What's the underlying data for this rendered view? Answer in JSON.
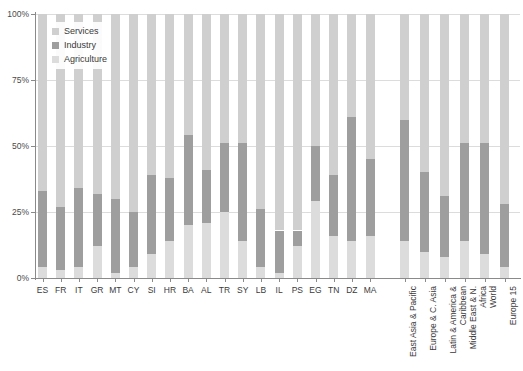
{
  "chart_data": {
    "type": "bar",
    "subtype": "stacked-100-percent",
    "title": "",
    "xlabel": "",
    "ylabel": "",
    "ylim": [
      0,
      100
    ],
    "ytick_labels": [
      "0%",
      "25%",
      "50%",
      "75%",
      "100%"
    ],
    "yticks": [
      0,
      25,
      50,
      75,
      100
    ],
    "grid": "horizontal",
    "legend_position": "top-left",
    "stack_order_bottom_to_top": [
      "Agriculture",
      "Industry",
      "Services"
    ],
    "series": [
      {
        "name": "Services",
        "color": "#cfcfcf"
      },
      {
        "name": "Industry",
        "color": "#9e9e9e"
      },
      {
        "name": "Agriculture",
        "color": "#dcdcdc"
      }
    ],
    "groups": [
      {
        "name": "countries",
        "categories": [
          "ES",
          "FR",
          "IT",
          "GR",
          "MT",
          "CY",
          "SI",
          "HR",
          "BA",
          "AL",
          "TR",
          "SY",
          "LB",
          "IL",
          "PS",
          "EG",
          "TN",
          "DZ",
          "MA"
        ],
        "values": {
          "Agriculture": [
            4,
            3,
            4,
            12,
            2,
            4,
            9,
            14,
            20,
            21,
            25,
            14,
            4,
            2,
            12,
            29,
            16,
            14,
            16
          ],
          "Industry": [
            29,
            24,
            30,
            20,
            28,
            21,
            30,
            24,
            34,
            20,
            26,
            37,
            22,
            16,
            6,
            21,
            23,
            47,
            29
          ],
          "Services": [
            67,
            73,
            66,
            68,
            70,
            75,
            61,
            62,
            46,
            59,
            49,
            49,
            74,
            82,
            82,
            50,
            61,
            39,
            55
          ]
        }
      },
      {
        "name": "regions",
        "categories": [
          "East Asia & Pacific",
          "Europe & C. Asia",
          "Latin & America & Caribbean",
          "Middle East & N. Africa",
          "World",
          "Europe 15"
        ],
        "values": {
          "Agriculture": [
            14,
            10,
            8,
            14,
            9,
            4
          ],
          "Industry": [
            46,
            30,
            23,
            37,
            42,
            24
          ],
          "Services": [
            40,
            60,
            69,
            49,
            49,
            72
          ]
        }
      }
    ]
  },
  "legend": {
    "items": [
      {
        "label": "Services",
        "color": "#cfcfcf"
      },
      {
        "label": "Industry",
        "color": "#9e9e9e"
      },
      {
        "label": "Agriculture",
        "color": "#dcdcdc"
      }
    ]
  }
}
